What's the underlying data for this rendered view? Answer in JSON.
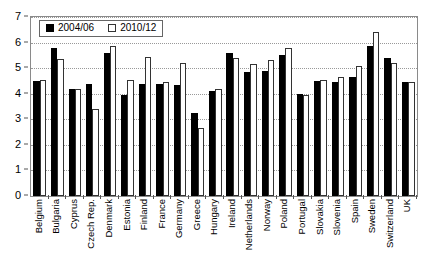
{
  "chart_data": {
    "type": "bar",
    "title": "",
    "subtitle": "",
    "xlabel": "",
    "ylabel": "",
    "ylim": [
      0,
      7
    ],
    "ytick_labels": [
      "0",
      "1",
      "2",
      "3",
      "4",
      "5",
      "6",
      "7"
    ],
    "yticks": [
      0,
      1,
      2,
      3,
      4,
      5,
      6,
      7
    ],
    "grid": true,
    "grid_axis": "y",
    "legend_position": "top-left",
    "categories": [
      "Belgium",
      "Bulgaria",
      "Cyprus",
      "Czech Rep.",
      "Denmark",
      "Estonia",
      "Finland",
      "France",
      "Germany",
      "Greece",
      "Hungary",
      "Ireland",
      "Netherlands",
      "Norway",
      "Poland",
      "Portugal",
      "Slovakia",
      "Slovenia",
      "Spain",
      "Sweden",
      "Switzerland",
      "UK"
    ],
    "series": [
      {
        "name": "2004/06",
        "color": "#000000",
        "style": "filled",
        "values": [
          4.5,
          5.8,
          4.2,
          4.4,
          5.6,
          3.95,
          4.4,
          4.4,
          4.35,
          3.25,
          4.1,
          5.6,
          4.85,
          4.9,
          5.5,
          4.0,
          4.5,
          4.45,
          4.65,
          5.85,
          5.4,
          4.45
        ]
      },
      {
        "name": "2010/12",
        "color": "#ffffff",
        "style": "open",
        "values": [
          4.55,
          5.35,
          4.2,
          3.4,
          5.85,
          4.55,
          5.45,
          4.45,
          5.2,
          2.65,
          4.2,
          5.4,
          5.15,
          5.3,
          5.8,
          3.95,
          4.55,
          4.65,
          5.1,
          6.4,
          5.2,
          4.45
        ]
      }
    ]
  },
  "legend": {
    "entries": [
      {
        "label": "2004/06",
        "swatch": "filled-square-icon"
      },
      {
        "label": "2010/12",
        "swatch": "open-square-icon"
      }
    ]
  }
}
